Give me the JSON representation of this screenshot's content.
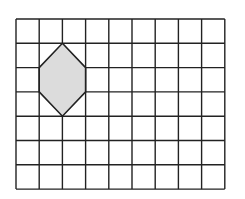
{
  "diagram": {
    "type": "grid-with-shape",
    "grid": {
      "columns": 9,
      "rows": 7,
      "origin_px": [
        16,
        19
      ],
      "cell_width_px": 23.2,
      "cell_height_px": 24.3,
      "line_color": "#222222"
    },
    "shape": {
      "kind": "hexagon",
      "fill": "#dcdcdc",
      "stroke": "#222222",
      "vertices_grid": [
        [
          2,
          1
        ],
        [
          3,
          2
        ],
        [
          3,
          3
        ],
        [
          2,
          4
        ],
        [
          1,
          3
        ],
        [
          1,
          2
        ]
      ]
    }
  }
}
